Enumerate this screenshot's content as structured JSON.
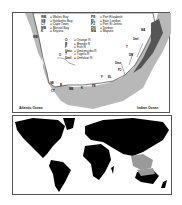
{
  "map_top": {
    "legend_towns_left": [
      {
        "code": "WB",
        "name": "Walvis Bay"
      },
      {
        "code": "SB",
        "name": "Saldanha Bay"
      },
      {
        "code": "CT",
        "name": "Cape Town"
      },
      {
        "code": "MB",
        "name": "Mossel Bay"
      },
      {
        "code": "K",
        "name": "Knysna"
      }
    ],
    "legend_towns_right": [
      {
        "code": "PE",
        "name": "Port Elizabeth"
      },
      {
        "code": "EL",
        "name": "East London"
      },
      {
        "code": "PJ",
        "name": "Port St Johns"
      },
      {
        "code": "DN",
        "name": "Durban"
      },
      {
        "code": "MA",
        "name": "Maputo"
      }
    ],
    "legend_rivers": [
      {
        "code": "O",
        "name": "Orange R"
      },
      {
        "code": "B",
        "name": "Breede R"
      },
      {
        "code": "F",
        "name": "Fish R"
      },
      {
        "code": "Umz",
        "name": "Umzimvubu R"
      },
      {
        "code": "T",
        "name": "Tugela R"
      },
      {
        "code": "Umf",
        "name": "Umfolozi R"
      }
    ],
    "map_labels": [
      "WB",
      "O",
      "SB",
      "CT",
      "B",
      "MB",
      "K",
      "PE",
      "F",
      "EL",
      "Umz",
      "PJ",
      "DN",
      "T",
      "Umf",
      "MA"
    ],
    "ocean_left": "Atlantic Ocean",
    "ocean_right": "Indian Ocean"
  },
  "colors": {
    "land": "#ffffff",
    "shelf": "#b8b8b8",
    "coast_dark": "#555555",
    "world_land": "#000000",
    "highlight": "#9a9a9a"
  }
}
